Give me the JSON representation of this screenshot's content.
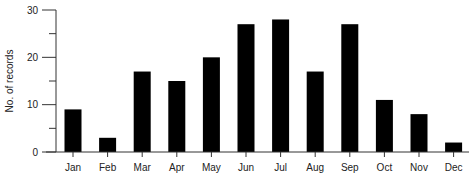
{
  "chart_data": {
    "type": "bar",
    "title": "",
    "xlabel": "",
    "ylabel": "No. of records",
    "categories": [
      "Jan",
      "Feb",
      "Mar",
      "Apr",
      "May",
      "Jun",
      "Jul",
      "Aug",
      "Sep",
      "Oct",
      "Nov",
      "Dec"
    ],
    "values": [
      9,
      3,
      17,
      15,
      20,
      27,
      28,
      17,
      27,
      11,
      8,
      2
    ],
    "ylim": [
      0,
      30
    ],
    "yticks_major": [
      0,
      10,
      20,
      30
    ],
    "yticks_minor": [
      5,
      15,
      25
    ],
    "ytick_labels": [
      "0",
      "10",
      "20",
      "30"
    ],
    "grid": false,
    "legend": "none",
    "bar_color": "#000000"
  }
}
